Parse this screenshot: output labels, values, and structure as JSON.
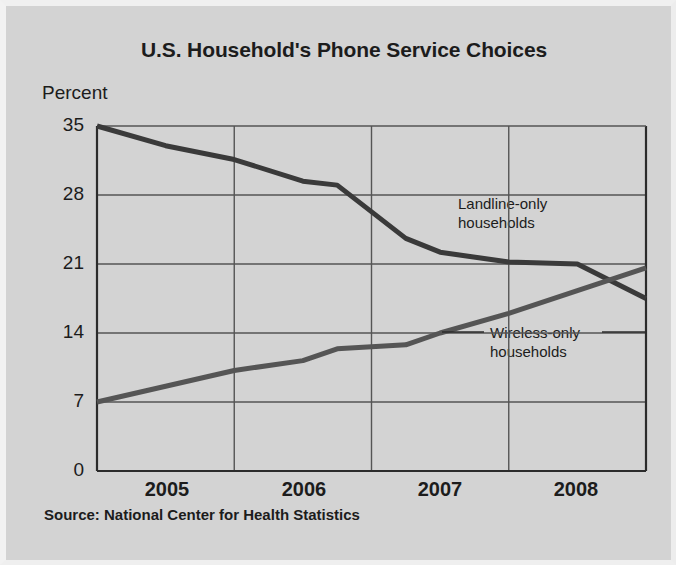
{
  "chart_data": {
    "type": "line",
    "title": "U.S. Household's Phone Service Choices",
    "ylabel": "Percent",
    "xlabel": "",
    "source": "Source: National Center for Health Statistics",
    "ylim": [
      0,
      35
    ],
    "yticks": [
      0,
      7,
      14,
      21,
      28,
      35
    ],
    "xlim": [
      2004.5,
      2008.5
    ],
    "categories": [
      "2005",
      "2006",
      "2007",
      "2008"
    ],
    "xticks": [
      "2005",
      "2006",
      "2007",
      "2008"
    ],
    "grid": true,
    "legend_position": "inline-annotations",
    "series": [
      {
        "name": "Landline-only households",
        "color": "#3a3a3a",
        "x": [
          2004.5,
          2005.0,
          2005.5,
          2006.0,
          2006.25,
          2006.75,
          2007.0,
          2007.5,
          2008.0,
          2008.5
        ],
        "values": [
          35.0,
          33.0,
          31.6,
          29.4,
          29.0,
          23.6,
          22.2,
          21.2,
          21.0,
          17.5
        ]
      },
      {
        "name": "Wireless-only households",
        "color": "#555555",
        "x": [
          2004.5,
          2005.0,
          2005.5,
          2006.0,
          2006.25,
          2006.75,
          2007.0,
          2007.5,
          2008.0,
          2008.5
        ],
        "values": [
          7.0,
          8.6,
          10.2,
          11.2,
          12.4,
          12.8,
          14.0,
          16.0,
          18.3,
          20.6
        ]
      }
    ],
    "annotations": [
      {
        "id": "landline",
        "lines": [
          "Landline-only",
          "households"
        ]
      },
      {
        "id": "wireless",
        "lines": [
          "Wireless-only",
          "households"
        ]
      }
    ]
  },
  "axis": {
    "ytick_0": "0",
    "ytick_7": "7",
    "ytick_14": "14",
    "ytick_21": "21",
    "ytick_28": "28",
    "ytick_35": "35",
    "xtick_2005": "2005",
    "xtick_2006": "2006",
    "xtick_2007": "2007",
    "xtick_2008": "2008"
  },
  "annotation_text": {
    "landline_line1": "Landline-only",
    "landline_line2": "households",
    "wireless_line1": "Wireless-only",
    "wireless_line2": "households"
  }
}
